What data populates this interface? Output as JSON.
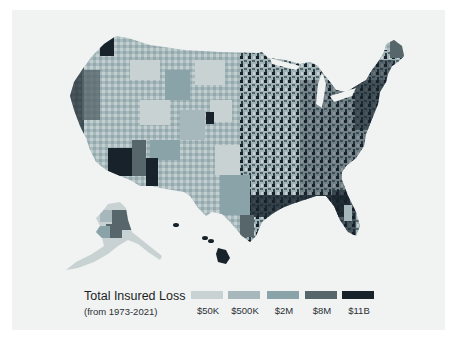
{
  "legend": {
    "title": "Total Insured Loss",
    "subtitle": "(from 1973-2021)",
    "items": [
      {
        "label": "$50K",
        "color": "#c9d2d3",
        "x": 111
      },
      {
        "label": "$500K",
        "color": "#a7b8bc",
        "x": 148
      },
      {
        "label": "$2M",
        "color": "#8aa3a9",
        "x": 187
      },
      {
        "label": "$8M",
        "color": "#56666b",
        "x": 225
      },
      {
        "label": "$11B",
        "color": "#17222b",
        "x": 262
      }
    ]
  },
  "map": {
    "subject": "United States counties choropleth",
    "regions": [
      "Contiguous United States",
      "Alaska",
      "Hawaii"
    ],
    "background_color": "#f1f2f2",
    "page_background": "#ffffff"
  }
}
